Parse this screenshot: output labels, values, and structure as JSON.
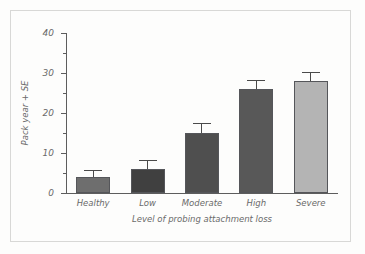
{
  "figure": {
    "background_color": "#fdfdfc",
    "frame_color": "#d8d8d6",
    "axis_color": "#5d5d5d",
    "text_color": "#6a6a6a"
  },
  "chart_data": {
    "type": "bar",
    "title": "",
    "subtitle": "",
    "xlabel": "Level of probing attachment loss",
    "ylabel": "Pack year + SE",
    "categories": [
      "Healthy",
      "Low",
      "Moderate",
      "High",
      "Severe"
    ],
    "values": [
      4,
      6,
      15,
      26,
      28
    ],
    "errors": [
      1.5,
      2,
      2.3,
      2,
      2
    ],
    "series": [
      {
        "name": "Pack year + SE",
        "values": [
          4,
          6,
          15,
          26,
          28
        ],
        "errors": [
          1.5,
          2,
          2.3,
          2,
          2
        ]
      }
    ],
    "bar_colors": [
      "#6e6e6e",
      "#404040",
      "#4f4f4f",
      "#585858",
      "#b4b4b4"
    ],
    "bar_edge_color": "#55565a",
    "error_bar_color": "#4a4a4a",
    "ylim": [
      0,
      40
    ],
    "y_major_ticks": [
      0,
      10,
      20,
      30,
      40
    ],
    "y_major_tick_labels": [
      "0",
      "10",
      "20",
      "30",
      "40"
    ],
    "y_minor_ticks": [
      5,
      15,
      25,
      35
    ],
    "grid": false,
    "legend": null,
    "legend_position": "none",
    "annotations": []
  }
}
